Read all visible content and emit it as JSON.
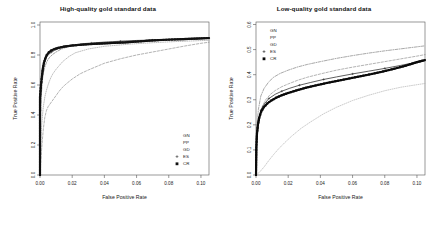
{
  "chart_data": [
    {
      "type": "line",
      "title": "High-quality gold standard data",
      "xlabel": "False Positive Rate",
      "ylabel": "True Positive Rate",
      "xlim": [
        0.0,
        0.105
      ],
      "ylim": [
        0.0,
        1.02
      ],
      "xticks": [
        0.0,
        0.02,
        0.04,
        0.06,
        0.08,
        0.1
      ],
      "xtick_labels": [
        "0.00",
        "0.02",
        "0.04",
        "0.06",
        "0.08",
        "0.10"
      ],
      "yticks": [
        0.0,
        0.2,
        0.4,
        0.6,
        0.8,
        1.0
      ],
      "ytick_labels": [
        "0.0",
        "0.2",
        "0.4",
        "0.6",
        "0.8",
        "1.0"
      ],
      "grid": false,
      "legend_position": "bottom-right",
      "series": [
        {
          "name": "GN",
          "style": "dashed",
          "marker": "none",
          "color": "#8a8a8a",
          "x": [
            0.0,
            0.001,
            0.002,
            0.003,
            0.004,
            0.005,
            0.006,
            0.008,
            0.01,
            0.012,
            0.014,
            0.016,
            0.02,
            0.025,
            0.03,
            0.04,
            0.05,
            0.06,
            0.07,
            0.08,
            0.09,
            0.1,
            0.105
          ],
          "values": [
            0.0,
            0.17,
            0.3,
            0.385,
            0.43,
            0.455,
            0.47,
            0.5,
            0.53,
            0.56,
            0.585,
            0.605,
            0.64,
            0.675,
            0.7,
            0.745,
            0.775,
            0.8,
            0.82,
            0.84,
            0.86,
            0.878,
            0.885
          ]
        },
        {
          "name": "PP",
          "style": "dotted",
          "marker": "none",
          "color": "#9a9a9a",
          "x": [
            0.0,
            0.001,
            0.002,
            0.003,
            0.004,
            0.005,
            0.006,
            0.007,
            0.008,
            0.01,
            0.012,
            0.014,
            0.018,
            0.022,
            0.03,
            0.04,
            0.055,
            0.07,
            0.085,
            0.1,
            0.105
          ],
          "values": [
            0.0,
            0.33,
            0.45,
            0.52,
            0.565,
            0.6,
            0.63,
            0.655,
            0.675,
            0.705,
            0.73,
            0.755,
            0.79,
            0.815,
            0.84,
            0.858,
            0.872,
            0.882,
            0.89,
            0.896,
            0.898
          ]
        },
        {
          "name": "GD",
          "style": "dashdot",
          "marker": "none",
          "color": "#6f6f6f",
          "x": [
            0.0,
            0.0005,
            0.001,
            0.0015,
            0.002,
            0.003,
            0.004,
            0.005,
            0.006,
            0.008,
            0.01,
            0.013,
            0.016,
            0.02,
            0.026,
            0.034,
            0.045,
            0.06,
            0.075,
            0.09,
            0.1,
            0.105
          ],
          "values": [
            0.0,
            0.42,
            0.56,
            0.63,
            0.675,
            0.72,
            0.75,
            0.77,
            0.785,
            0.805,
            0.82,
            0.838,
            0.85,
            0.862,
            0.872,
            0.88,
            0.888,
            0.895,
            0.9,
            0.905,
            0.908,
            0.91
          ]
        },
        {
          "name": "ES",
          "style": "solid",
          "marker": "plus",
          "color": "#3a3a3a",
          "x": [
            0.0002,
            0.0008,
            0.0015,
            0.0025,
            0.0035,
            0.005,
            0.007,
            0.009,
            0.012,
            0.016,
            0.02,
            0.026,
            0.032,
            0.04,
            0.05,
            0.06,
            0.07,
            0.08,
            0.09,
            0.1,
            0.105
          ],
          "values": [
            0.43,
            0.62,
            0.7,
            0.745,
            0.775,
            0.8,
            0.818,
            0.83,
            0.845,
            0.858,
            0.866,
            0.875,
            0.88,
            0.886,
            0.892,
            0.897,
            0.9,
            0.904,
            0.907,
            0.91,
            0.912
          ]
        },
        {
          "name": "CR",
          "style": "solid",
          "marker": "square",
          "color": "#111111",
          "x": [
            0.0,
            0.0,
            0.0003,
            0.0006,
            0.001,
            0.0014,
            0.0018,
            0.0024,
            0.0032,
            0.0042,
            0.0055,
            0.007,
            0.009,
            0.0115,
            0.015,
            0.019,
            0.024,
            0.03,
            0.037,
            0.045,
            0.053,
            0.061,
            0.068,
            0.075,
            0.082,
            0.089,
            0.096,
            0.102,
            0.105
          ],
          "values": [
            0.0,
            0.52,
            0.56,
            0.6,
            0.64,
            0.675,
            0.71,
            0.745,
            0.775,
            0.8,
            0.818,
            0.83,
            0.84,
            0.848,
            0.856,
            0.862,
            0.867,
            0.872,
            0.876,
            0.88,
            0.884,
            0.89,
            0.896,
            0.9,
            0.903,
            0.906,
            0.909,
            0.912,
            0.913
          ]
        }
      ]
    },
    {
      "type": "line",
      "title": "Low-quality gold standard data",
      "xlabel": "False Positive Rate",
      "ylabel": "True Positive Rate",
      "xlim": [
        0.0,
        0.105
      ],
      "ylim": [
        0.0,
        0.61
      ],
      "xticks": [
        0.0,
        0.02,
        0.04,
        0.06,
        0.08,
        0.1
      ],
      "xtick_labels": [
        "0.00",
        "0.02",
        "0.04",
        "0.06",
        "0.08",
        "0.10"
      ],
      "yticks": [
        0.0,
        0.1,
        0.2,
        0.3,
        0.4,
        0.5,
        0.6
      ],
      "ytick_labels": [
        "0.0",
        "0.1",
        "0.2",
        "0.3",
        "0.4",
        "0.5",
        "0.6"
      ],
      "grid": false,
      "legend_position": "top-left",
      "series": [
        {
          "name": "GN",
          "style": "dashed",
          "marker": "none",
          "color": "#8a8a8a",
          "x": [
            0.0,
            0.0008,
            0.002,
            0.004,
            0.006,
            0.009,
            0.012,
            0.016,
            0.02,
            0.026,
            0.032,
            0.04,
            0.05,
            0.06,
            0.07,
            0.08,
            0.09,
            0.1,
            0.105
          ],
          "values": [
            0.0,
            0.15,
            0.225,
            0.275,
            0.3,
            0.322,
            0.337,
            0.352,
            0.363,
            0.378,
            0.39,
            0.403,
            0.418,
            0.43,
            0.441,
            0.452,
            0.463,
            0.474,
            0.48
          ]
        },
        {
          "name": "PP",
          "style": "dotted",
          "marker": "none",
          "color": "#b0b0b0",
          "x": [
            0.0,
            0.002,
            0.005,
            0.008,
            0.011,
            0.014,
            0.018,
            0.022,
            0.028,
            0.034,
            0.042,
            0.05,
            0.06,
            0.07,
            0.08,
            0.09,
            0.1,
            0.105
          ],
          "values": [
            0.0,
            0.01,
            0.032,
            0.058,
            0.082,
            0.104,
            0.13,
            0.154,
            0.186,
            0.212,
            0.244,
            0.27,
            0.297,
            0.318,
            0.336,
            0.35,
            0.36,
            0.365
          ]
        },
        {
          "name": "GD",
          "style": "dashdot",
          "marker": "none",
          "color": "#7a7a7a",
          "x": [
            0.0,
            0.0006,
            0.0015,
            0.003,
            0.005,
            0.008,
            0.011,
            0.015,
            0.02,
            0.026,
            0.032,
            0.04,
            0.05,
            0.06,
            0.07,
            0.08,
            0.09,
            0.1,
            0.105
          ],
          "values": [
            0.0,
            0.195,
            0.262,
            0.315,
            0.345,
            0.372,
            0.39,
            0.405,
            0.418,
            0.431,
            0.441,
            0.452,
            0.465,
            0.476,
            0.486,
            0.495,
            0.503,
            0.511,
            0.515
          ]
        },
        {
          "name": "ES",
          "style": "solid",
          "marker": "plus",
          "color": "#2a2a2a",
          "x": [
            0.0005,
            0.0015,
            0.003,
            0.005,
            0.008,
            0.012,
            0.016,
            0.021,
            0.027,
            0.034,
            0.042,
            0.05,
            0.06,
            0.07,
            0.08,
            0.09,
            0.1,
            0.105
          ],
          "values": [
            0.15,
            0.215,
            0.258,
            0.282,
            0.305,
            0.322,
            0.334,
            0.346,
            0.358,
            0.369,
            0.381,
            0.391,
            0.403,
            0.414,
            0.425,
            0.437,
            0.45,
            0.457
          ]
        },
        {
          "name": "CR",
          "style": "solid",
          "marker": "square",
          "color": "#0a0a0a",
          "x": [
            0.0,
            0.0002,
            0.0006,
            0.0012,
            0.002,
            0.0032,
            0.0048,
            0.007,
            0.0095,
            0.0125,
            0.016,
            0.02,
            0.025,
            0.031,
            0.037,
            0.044,
            0.051,
            0.058,
            0.065,
            0.072,
            0.079,
            0.086,
            0.093,
            0.1,
            0.105
          ],
          "values": [
            0.0,
            0.11,
            0.165,
            0.2,
            0.228,
            0.252,
            0.27,
            0.285,
            0.297,
            0.308,
            0.318,
            0.327,
            0.337,
            0.348,
            0.357,
            0.367,
            0.376,
            0.385,
            0.394,
            0.403,
            0.413,
            0.424,
            0.436,
            0.45,
            0.458
          ]
        }
      ]
    }
  ]
}
